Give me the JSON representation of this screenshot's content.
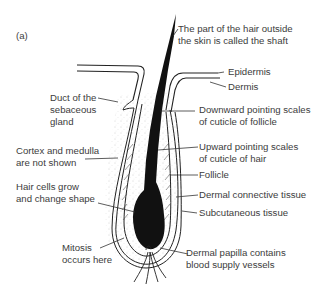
{
  "figure": {
    "panel_label": "(a)"
  },
  "labels": {
    "shaft": [
      "The part of the hair outside",
      "the skin is called the shaft"
    ],
    "epidermis": "Epidermis",
    "dermis": "Dermis",
    "duct": [
      "Duct of the",
      "sebaceous",
      "gland"
    ],
    "downward_scales": [
      "Downward pointing scales",
      "of cuticle of follicle"
    ],
    "cortex": [
      "Cortex and medulla",
      "are not shown"
    ],
    "upward_scales": [
      "Upward pointing scales",
      "of cuticle of hair"
    ],
    "follicle": "Follicle",
    "hair_cells": [
      "Hair cells grow",
      "and change shape"
    ],
    "dermal_connective": "Dermal connective tissue",
    "subcutaneous": "Subcutaneous tissue",
    "mitosis": [
      "Mitosis",
      "occurs here"
    ],
    "papilla": [
      "Dermal papilla contains",
      "blood supply vessels"
    ]
  }
}
